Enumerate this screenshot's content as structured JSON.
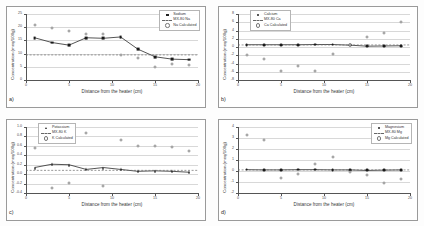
{
  "figure": {
    "panels": [
      "a)",
      "b)",
      "c)",
      "d)"
    ],
    "shared_xlabel": "Distance from the heater (cm)",
    "shared_ylabel": "Concentration (meq/100g)"
  },
  "chart_data": [
    {
      "type": "scatter",
      "panel": "a)",
      "title": "",
      "xlabel": "Distance from the heater (cm)",
      "ylabel": "Concentration (meq/100g)",
      "xlim": [
        0,
        20
      ],
      "ylim": [
        0,
        25
      ],
      "xticks": [
        0,
        5,
        10,
        15,
        20
      ],
      "yticks": [
        0,
        5,
        10,
        15,
        20,
        25
      ],
      "grid": true,
      "legend_position": "top-right",
      "x": [
        1,
        3,
        5,
        7,
        9,
        11,
        13,
        15,
        17,
        19
      ],
      "series": [
        {
          "name": "Sodium",
          "marker": "square-filled",
          "line": true,
          "values": [
            16.0,
            14.2,
            13.2,
            16.0,
            15.8,
            16.3,
            11.7,
            8.8,
            7.9,
            7.7
          ]
        },
        {
          "name": "MX-80 Na",
          "marker": "reference-line",
          "line": true,
          "constant": 9.5,
          "values": [
            9.5,
            9.5,
            9.5,
            9.5,
            9.5,
            9.5,
            9.5,
            9.5,
            9.5,
            9.5
          ]
        },
        {
          "name": "Na Calculated",
          "marker": "circle-open",
          "line": false,
          "values": [
            21.0,
            19.8,
            18.5,
            17.5,
            17.4,
            9.5,
            8.3,
            5.0,
            6.0,
            5.8
          ]
        }
      ]
    },
    {
      "type": "scatter",
      "panel": "b)",
      "title": "",
      "xlabel": "Distance from the heater (cm)",
      "ylabel": "Concentration (meq/100g)",
      "xlim": [
        0,
        20
      ],
      "ylim": [
        -8,
        8
      ],
      "xticks": [
        0,
        5,
        10,
        15,
        20
      ],
      "yticks": [
        -8,
        -6,
        -4,
        -2,
        0,
        2,
        4,
        6,
        8
      ],
      "grid": true,
      "legend_position": "top-left",
      "x": [
        1,
        3,
        5,
        7,
        9,
        11,
        13,
        15,
        17,
        19
      ],
      "series": [
        {
          "name": "Calcium",
          "marker": "circle-filled",
          "line": true,
          "values": [
            0.55,
            0.55,
            0.55,
            0.55,
            0.6,
            0.6,
            0.45,
            0.2,
            0.25,
            0.3
          ]
        },
        {
          "name": "MX-80 Ca",
          "marker": "reference-line",
          "line": true,
          "constant": 0.5,
          "values": [
            0.5,
            0.5,
            0.5,
            0.5,
            0.5,
            0.5,
            0.5,
            0.5,
            0.5,
            0.5
          ]
        },
        {
          "name": "Ca Calculated",
          "marker": "circle-open",
          "line": false,
          "values": [
            -2.0,
            -3.0,
            -5.9,
            -4.6,
            -5.9,
            -1.6,
            0.6,
            2.4,
            3.4,
            6.0
          ]
        }
      ]
    },
    {
      "type": "scatter",
      "panel": "c)",
      "title": "",
      "xlabel": "Distance from the heater (cm)",
      "ylabel": "Concentration (meq/100g)",
      "xlim": [
        0,
        20
      ],
      "ylim": [
        -0.4,
        1.0
      ],
      "xticks": [
        0,
        5,
        10,
        15,
        20
      ],
      "yticks": [
        -0.4,
        -0.2,
        0.0,
        0.2,
        0.4,
        0.6,
        0.8,
        1.0
      ],
      "grid": true,
      "legend_position": "top-left",
      "x": [
        1,
        3,
        5,
        7,
        9,
        11,
        13,
        15,
        17,
        19
      ],
      "series": [
        {
          "name": "Potassium",
          "marker": "triangle-filled",
          "line": true,
          "values": [
            0.14,
            0.21,
            0.2,
            0.1,
            0.14,
            0.1,
            0.06,
            0.07,
            0.06,
            0.04
          ]
        },
        {
          "name": "MX-80 K",
          "marker": "reference-line",
          "line": true,
          "constant": 0.08,
          "values": [
            0.08,
            0.08,
            0.08,
            0.08,
            0.08,
            0.08,
            0.08,
            0.08,
            0.08,
            0.08
          ]
        },
        {
          "name": "K Calculated",
          "marker": "circle-open",
          "line": false,
          "values": [
            0.56,
            -0.3,
            -0.19,
            0.88,
            -0.26,
            0.72,
            0.6,
            0.6,
            0.57,
            0.49
          ]
        }
      ]
    },
    {
      "type": "scatter",
      "panel": "d)",
      "title": "",
      "xlabel": "Distance from the heater (cm)",
      "ylabel": "Concentration (meq/100g)",
      "xlim": [
        0,
        20
      ],
      "ylim": [
        -2,
        4
      ],
      "xticks": [
        0,
        5,
        10,
        15,
        20
      ],
      "yticks": [
        -2,
        -1,
        0,
        1,
        2,
        3,
        4
      ],
      "grid": true,
      "legend_position": "top-right",
      "x": [
        1,
        3,
        5,
        7,
        9,
        11,
        13,
        15,
        17,
        19
      ],
      "series": [
        {
          "name": "Magnesium",
          "marker": "circle-filled",
          "line": true,
          "values": [
            0.12,
            0.1,
            0.1,
            0.12,
            0.12,
            0.1,
            0.1,
            0.05,
            0.08,
            0.1
          ]
        },
        {
          "name": "MX-80 Mg",
          "marker": "reference-line",
          "line": true,
          "constant": 0.1,
          "values": [
            0.1,
            0.1,
            0.1,
            0.1,
            0.1,
            0.1,
            0.1,
            0.1,
            0.1,
            0.1
          ]
        },
        {
          "name": "Mg Calculated",
          "marker": "circle-open",
          "line": false,
          "values": [
            3.3,
            2.8,
            -0.6,
            -0.25,
            0.65,
            1.3,
            -0.05,
            -0.4,
            -1.1,
            -0.75
          ]
        }
      ]
    }
  ]
}
